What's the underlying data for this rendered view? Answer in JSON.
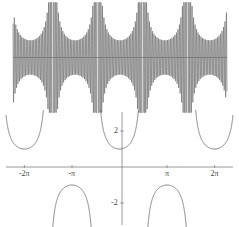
{
  "figure": {
    "title": "",
    "panels": [
      {
        "id": "oscillation-panel",
        "description": "rapidly oscillating function with secant-like envelope"
      },
      {
        "id": "secant-panel",
        "description": "secant curve with vertical asymptotes"
      }
    ]
  },
  "axis": {
    "x_labels": [
      {
        "key": "xm2pi",
        "text": "-2π",
        "value": -6.2832
      },
      {
        "key": "xm1pi",
        "text": "-π",
        "value": -3.1416
      },
      {
        "key": "xp1pi",
        "text": "π",
        "value": 3.1416
      },
      {
        "key": "xp2pi",
        "text": "2π",
        "value": 6.2832
      }
    ],
    "y_labels": [
      {
        "key": "yp2",
        "text": "2",
        "value": 2
      },
      {
        "key": "ym2",
        "text": "-2",
        "value": -2
      }
    ]
  },
  "chart_data": [
    {
      "type": "line",
      "id": "top-oscillation",
      "title": "",
      "xlabel": "",
      "ylabel": "",
      "xlim": [
        -7.5,
        7.5
      ],
      "ylim": [
        -3.2,
        3.2
      ],
      "grid": false,
      "legend": null,
      "series": [
        {
          "name": "sec(x) modulated high-frequency oscillation",
          "formula": "sec(x)*sin(60x)",
          "frequency": 60,
          "envelope": "sec(x)",
          "asymptotes": [
            -7.854,
            -4.712,
            -1.571,
            1.571,
            4.712,
            7.854
          ],
          "envelope_min_abs": 1,
          "clip_abs": 3.2
        }
      ],
      "annotations": []
    },
    {
      "type": "line",
      "id": "bottom-secant",
      "title": "",
      "xlabel": "",
      "ylabel": "",
      "xlim": [
        -7.5,
        7.5
      ],
      "ylim": [
        -3.6,
        3.6
      ],
      "grid": false,
      "legend": null,
      "xticks": [
        -6.2832,
        -3.1416,
        3.1416,
        6.2832
      ],
      "xticklabels": [
        "-2π",
        "-π",
        "π",
        "2π"
      ],
      "yticks": [
        2,
        -2
      ],
      "yticklabels": [
        "2",
        "-2"
      ],
      "series": [
        {
          "name": "sec(x)",
          "formula": "1/cos(x)",
          "asymptotes": [
            -7.854,
            -4.712,
            -1.571,
            1.571,
            4.712,
            7.854
          ],
          "branch_extrema": [
            {
              "x": -6.2832,
              "y": 1
            },
            {
              "x": -3.1416,
              "y": -1
            },
            {
              "x": 0,
              "y": 1
            },
            {
              "x": 3.1416,
              "y": -1
            },
            {
              "x": 6.2832,
              "y": 1
            }
          ]
        }
      ],
      "annotations": []
    }
  ],
  "colors": {
    "curve": "#5b5b5b",
    "oscillation": "#3a3a3a",
    "axis": "#6e6e6e",
    "label": "#444444",
    "background": "#ffffff"
  }
}
